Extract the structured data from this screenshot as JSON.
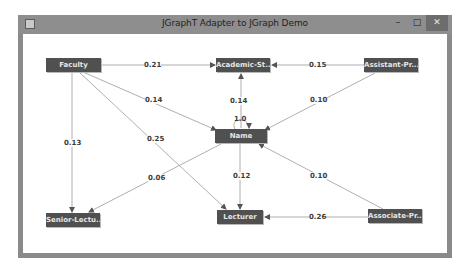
{
  "window": {
    "title": "JGraphT Adapter to JGraph Demo",
    "controls": {
      "minimize": "–",
      "maximize": "□",
      "close": "✕"
    },
    "app_icon": "java-app-icon"
  },
  "graph": {
    "nodes": [
      {
        "id": "faculty",
        "label": "Faculty"
      },
      {
        "id": "academic",
        "label": "Academic-St..."
      },
      {
        "id": "assistant",
        "label": "Assistant-Pr..."
      },
      {
        "id": "name",
        "label": "Name"
      },
      {
        "id": "senior",
        "label": "Senior-Lectu..."
      },
      {
        "id": "lecturer",
        "label": "Lecturer"
      },
      {
        "id": "associate",
        "label": "Associate-Pr..."
      }
    ],
    "edges": [
      {
        "from": "faculty",
        "to": "academic",
        "weight": "0.21"
      },
      {
        "from": "assistant",
        "to": "academic",
        "weight": "0.15"
      },
      {
        "from": "faculty",
        "to": "name",
        "weight": "0.14"
      },
      {
        "from": "name",
        "to": "academic",
        "weight": "0.14"
      },
      {
        "from": "name",
        "to": "name",
        "weight": "1.0"
      },
      {
        "from": "assistant",
        "to": "name",
        "weight": "0.10"
      },
      {
        "from": "faculty",
        "to": "senior",
        "weight": "0.13"
      },
      {
        "from": "faculty",
        "to": "lecturer",
        "weight": "0.25"
      },
      {
        "from": "name",
        "to": "senior",
        "weight": "0.06"
      },
      {
        "from": "name",
        "to": "lecturer",
        "weight": "0.12"
      },
      {
        "from": "associate",
        "to": "name",
        "weight": "0.10"
      },
      {
        "from": "associate",
        "to": "lecturer",
        "weight": "0.26"
      }
    ]
  }
}
